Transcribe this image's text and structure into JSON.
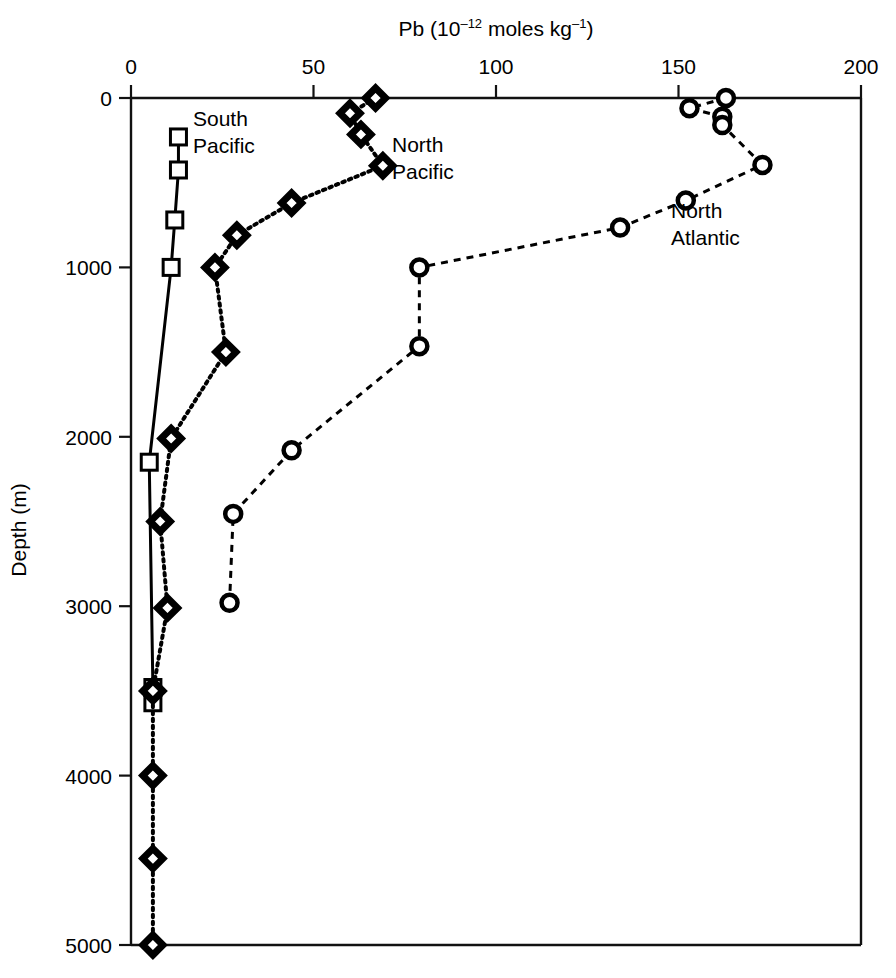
{
  "chart_data": {
    "type": "line",
    "title_parts": {
      "prefix": "Pb (10",
      "exp1": "‒12",
      "middle": " moles kg",
      "exp2": "‒1",
      "suffix": ")"
    },
    "xlabel": "Pb (10⁻¹² moles kg⁻¹)",
    "ylabel": "Depth (m)",
    "xlim": [
      0,
      200
    ],
    "ylim": [
      5000,
      0
    ],
    "x_axis_position": "top",
    "y_axis_inverted": true,
    "grid": false,
    "legend_position": "inline-annotations",
    "xticks": [
      0,
      50,
      100,
      150,
      200
    ],
    "xtick_labels": [
      "0",
      "50",
      "100",
      "150",
      "200"
    ],
    "yticks": [
      0,
      1000,
      2000,
      3000,
      4000,
      5000
    ],
    "ytick_labels": [
      "0",
      "1000",
      "2000",
      "3000",
      "4000",
      "5000"
    ],
    "series": [
      {
        "name": "South Pacific",
        "marker": "square",
        "linestyle": "solid",
        "color": "#000000",
        "label_x": 36,
        "label_depth": 190,
        "points": [
          {
            "pb": 13,
            "depth": 230
          },
          {
            "pb": 13,
            "depth": 425
          },
          {
            "pb": 12,
            "depth": 720
          },
          {
            "pb": 11,
            "depth": 1000
          },
          {
            "pb": 5,
            "depth": 2150
          },
          {
            "pb": 6,
            "depth": 3480
          },
          {
            "pb": 6,
            "depth": 3570
          }
        ]
      },
      {
        "name": "North Pacific",
        "marker": "diamond",
        "linestyle": "dotted",
        "color": "#000000",
        "label_x": 72,
        "label_depth": 215,
        "points": [
          {
            "pb": 67,
            "depth": 0
          },
          {
            "pb": 60,
            "depth": 90
          },
          {
            "pb": 63,
            "depth": 215
          },
          {
            "pb": 69,
            "depth": 400
          },
          {
            "pb": 44,
            "depth": 620
          },
          {
            "pb": 29,
            "depth": 810
          },
          {
            "pb": 23,
            "depth": 1000
          },
          {
            "pb": 26,
            "depth": 1500
          },
          {
            "pb": 11,
            "depth": 2010
          },
          {
            "pb": 8,
            "depth": 2500
          },
          {
            "pb": 10,
            "depth": 3010
          },
          {
            "pb": 6,
            "depth": 3500
          },
          {
            "pb": 6,
            "depth": 4000
          },
          {
            "pb": 6,
            "depth": 4490
          },
          {
            "pb": 6,
            "depth": 5000
          }
        ]
      },
      {
        "name": "North Atlantic",
        "marker": "circle",
        "linestyle": "dashed",
        "color": "#000000",
        "label_x": 157,
        "label_depth": 680,
        "points": [
          {
            "pb": 163,
            "depth": 0
          },
          {
            "pb": 153,
            "depth": 60
          },
          {
            "pb": 162,
            "depth": 110
          },
          {
            "pb": 162,
            "depth": 160
          },
          {
            "pb": 173,
            "depth": 395
          },
          {
            "pb": 152,
            "depth": 605
          },
          {
            "pb": 134,
            "depth": 765
          },
          {
            "pb": 79,
            "depth": 1000
          },
          {
            "pb": 79,
            "depth": 1465
          },
          {
            "pb": 44,
            "depth": 2080
          },
          {
            "pb": 28,
            "depth": 2455
          },
          {
            "pb": 27,
            "depth": 2980
          }
        ]
      }
    ]
  },
  "annotations": {
    "south_pacific_line1": "South",
    "south_pacific_line2": "Pacific",
    "north_pacific_line1": "North",
    "north_pacific_line2": "Pacific",
    "north_atlantic_line1": "North",
    "north_atlantic_line2": "Atlantic"
  }
}
